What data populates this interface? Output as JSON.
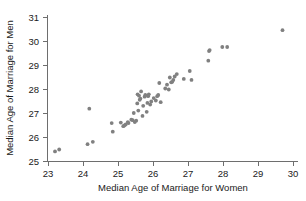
{
  "chart_data": {
    "type": "scatter",
    "title": "",
    "xlabel": "Median Age of Marriage for Women",
    "ylabel": "Median Age of Marriage for Men",
    "xlim": [
      22.7,
      30.3
    ],
    "ylim": [
      24.85,
      31.25
    ],
    "xticks": [
      23,
      24,
      25,
      26,
      27,
      28,
      29,
      30
    ],
    "yticks": [
      25,
      26,
      27,
      28,
      29,
      30,
      31
    ],
    "xticklabels": [
      "23",
      "24",
      "25",
      "26",
      "27",
      "28",
      "29",
      "30"
    ],
    "yticklabels": [
      "25",
      "26",
      "27",
      "28",
      "29",
      "30",
      "31"
    ],
    "grid": false,
    "legend": null,
    "marker": {
      "shape": "circle",
      "color": "#808080",
      "radius": 1.9
    },
    "series": [
      {
        "name": "States",
        "points": [
          [
            23.2,
            25.4
          ],
          [
            23.32,
            25.48
          ],
          [
            24.13,
            25.7
          ],
          [
            24.28,
            25.8
          ],
          [
            24.18,
            27.18
          ],
          [
            24.82,
            26.58
          ],
          [
            24.85,
            26.22
          ],
          [
            25.08,
            26.6
          ],
          [
            25.15,
            26.45
          ],
          [
            25.18,
            26.48
          ],
          [
            25.22,
            26.52
          ],
          [
            25.28,
            26.62
          ],
          [
            25.3,
            26.58
          ],
          [
            25.38,
            26.72
          ],
          [
            25.42,
            26.7
          ],
          [
            25.45,
            27.0
          ],
          [
            25.48,
            26.62
          ],
          [
            25.52,
            26.68
          ],
          [
            25.55,
            27.4
          ],
          [
            25.56,
            27.78
          ],
          [
            25.58,
            27.1
          ],
          [
            25.6,
            27.72
          ],
          [
            25.62,
            27.55
          ],
          [
            25.64,
            27.6
          ],
          [
            25.66,
            27.9
          ],
          [
            25.7,
            26.88
          ],
          [
            25.72,
            27.3
          ],
          [
            25.76,
            27.68
          ],
          [
            25.78,
            27.75
          ],
          [
            25.82,
            27.05
          ],
          [
            25.84,
            27.42
          ],
          [
            25.86,
            27.7
          ],
          [
            25.88,
            27.78
          ],
          [
            25.92,
            27.35
          ],
          [
            25.95,
            27.48
          ],
          [
            26.02,
            27.62
          ],
          [
            26.08,
            27.52
          ],
          [
            26.12,
            27.7
          ],
          [
            26.15,
            27.75
          ],
          [
            26.18,
            28.25
          ],
          [
            26.22,
            27.45
          ],
          [
            26.35,
            28.02
          ],
          [
            26.4,
            28.18
          ],
          [
            26.45,
            27.98
          ],
          [
            26.48,
            28.48
          ],
          [
            26.52,
            28.28
          ],
          [
            26.55,
            28.3
          ],
          [
            26.58,
            28.38
          ],
          [
            26.62,
            28.52
          ],
          [
            26.68,
            28.62
          ],
          [
            26.88,
            28.42
          ],
          [
            27.05,
            28.75
          ],
          [
            27.1,
            28.38
          ],
          [
            27.58,
            29.18
          ],
          [
            27.6,
            29.58
          ],
          [
            27.62,
            29.62
          ],
          [
            27.98,
            29.75
          ],
          [
            28.12,
            29.75
          ],
          [
            29.7,
            30.45
          ]
        ]
      }
    ]
  }
}
